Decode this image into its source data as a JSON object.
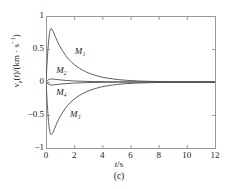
{
  "chart_data": {
    "type": "line",
    "title": "",
    "caption": "(c)",
    "xlabel": "t/s",
    "ylabel": "v_z(t)/(km · s^-1)",
    "ylabel_parts": {
      "symbol": "v",
      "symbol_sub": "z",
      "arg": "(t)",
      "divider": "/(",
      "unit": "km · s",
      "unit_exp": "-1",
      "close": ")"
    },
    "xlim": [
      0,
      12
    ],
    "ylim": [
      -1,
      1
    ],
    "xticks": [
      0,
      2,
      4,
      6,
      8,
      10,
      12
    ],
    "xtick_labels": [
      "0",
      "2",
      "4",
      "6",
      "8",
      "10",
      "12"
    ],
    "yticks": [
      -1,
      -0.5,
      0,
      0.5,
      1
    ],
    "ytick_labels": [
      "-1",
      "-0.5",
      "0",
      "0.5",
      "1"
    ],
    "grid": false,
    "legend": "inline-annotations",
    "line_color": "#4d4d4d",
    "axis_color": "#999999",
    "series": [
      {
        "name": "M1",
        "label": "M₁",
        "label_x": 2.05,
        "label_y": 0.46,
        "peak": {
          "t": 0.35,
          "v": 0.81
        },
        "points": [
          [
            0.0,
            0.0
          ],
          [
            0.08,
            0.3
          ],
          [
            0.16,
            0.56
          ],
          [
            0.24,
            0.72
          ],
          [
            0.32,
            0.8
          ],
          [
            0.4,
            0.805
          ],
          [
            0.5,
            0.77
          ],
          [
            0.62,
            0.71
          ],
          [
            0.78,
            0.63
          ],
          [
            0.95,
            0.555
          ],
          [
            1.15,
            0.48
          ],
          [
            1.4,
            0.4
          ],
          [
            1.7,
            0.325
          ],
          [
            2.0,
            0.265
          ],
          [
            2.4,
            0.205
          ],
          [
            2.8,
            0.158
          ],
          [
            3.2,
            0.122
          ],
          [
            3.7,
            0.089
          ],
          [
            4.2,
            0.065
          ],
          [
            4.8,
            0.045
          ],
          [
            5.4,
            0.031
          ],
          [
            6.1,
            0.021
          ],
          [
            6.9,
            0.013
          ],
          [
            7.8,
            0.008
          ],
          [
            8.8,
            0.005
          ],
          [
            10.0,
            0.003
          ],
          [
            11.0,
            0.002
          ],
          [
            12.0,
            0.001
          ]
        ]
      },
      {
        "name": "M2",
        "label": "M₂",
        "label_x": 0.72,
        "label_y": 0.16,
        "peak": {
          "t": 0.4,
          "v": 0.045
        },
        "points": [
          [
            0.0,
            0.0
          ],
          [
            0.1,
            0.022
          ],
          [
            0.2,
            0.036
          ],
          [
            0.32,
            0.044
          ],
          [
            0.45,
            0.045
          ],
          [
            0.6,
            0.042
          ],
          [
            0.8,
            0.037
          ],
          [
            1.05,
            0.031
          ],
          [
            1.35,
            0.025
          ],
          [
            1.7,
            0.02
          ],
          [
            2.1,
            0.015
          ],
          [
            2.6,
            0.011
          ],
          [
            3.2,
            0.008
          ],
          [
            3.9,
            0.005
          ],
          [
            4.7,
            0.003
          ],
          [
            5.6,
            0.002
          ],
          [
            6.6,
            0.0013
          ],
          [
            7.8,
            0.0008
          ],
          [
            9.0,
            0.0004
          ],
          [
            10.5,
            0.0002
          ],
          [
            12.0,
            0.0001
          ]
        ]
      },
      {
        "name": "M3",
        "label": "M₃",
        "label_x": 1.7,
        "label_y": -0.5,
        "peak": {
          "t": 0.35,
          "v": -0.8
        },
        "points": [
          [
            0.0,
            0.0
          ],
          [
            0.08,
            -0.29
          ],
          [
            0.16,
            -0.55
          ],
          [
            0.24,
            -0.71
          ],
          [
            0.32,
            -0.79
          ],
          [
            0.4,
            -0.795
          ],
          [
            0.5,
            -0.76
          ],
          [
            0.62,
            -0.7
          ],
          [
            0.78,
            -0.62
          ],
          [
            0.95,
            -0.545
          ],
          [
            1.15,
            -0.47
          ],
          [
            1.4,
            -0.39
          ],
          [
            1.7,
            -0.318
          ],
          [
            2.0,
            -0.259
          ],
          [
            2.4,
            -0.2
          ],
          [
            2.8,
            -0.154
          ],
          [
            3.2,
            -0.119
          ],
          [
            3.7,
            -0.087
          ],
          [
            4.2,
            -0.063
          ],
          [
            4.8,
            -0.044
          ],
          [
            5.4,
            -0.03
          ],
          [
            6.1,
            -0.02
          ],
          [
            6.9,
            -0.013
          ],
          [
            7.8,
            -0.008
          ],
          [
            8.8,
            -0.005
          ],
          [
            10.0,
            -0.003
          ],
          [
            11.0,
            -0.002
          ],
          [
            12.0,
            -0.001
          ]
        ]
      },
      {
        "name": "M4",
        "label": "M₄",
        "label_x": 0.72,
        "label_y": -0.16,
        "peak": {
          "t": 0.4,
          "v": -0.045
        },
        "points": [
          [
            0.0,
            0.0
          ],
          [
            0.1,
            -0.022
          ],
          [
            0.2,
            -0.036
          ],
          [
            0.32,
            -0.044
          ],
          [
            0.45,
            -0.045
          ],
          [
            0.6,
            -0.042
          ],
          [
            0.8,
            -0.037
          ],
          [
            1.05,
            -0.031
          ],
          [
            1.35,
            -0.025
          ],
          [
            1.7,
            -0.02
          ],
          [
            2.1,
            -0.015
          ],
          [
            2.6,
            -0.011
          ],
          [
            3.2,
            -0.008
          ],
          [
            3.9,
            -0.005
          ],
          [
            4.7,
            -0.003
          ],
          [
            5.6,
            -0.002
          ],
          [
            6.6,
            -0.0013
          ],
          [
            7.8,
            -0.0008
          ],
          [
            9.0,
            -0.0004
          ],
          [
            10.5,
            -0.0002
          ],
          [
            12.0,
            -0.0001
          ]
        ]
      }
    ]
  },
  "plot_box": {
    "left": 46,
    "top": 16,
    "right": 215,
    "bottom": 148
  }
}
